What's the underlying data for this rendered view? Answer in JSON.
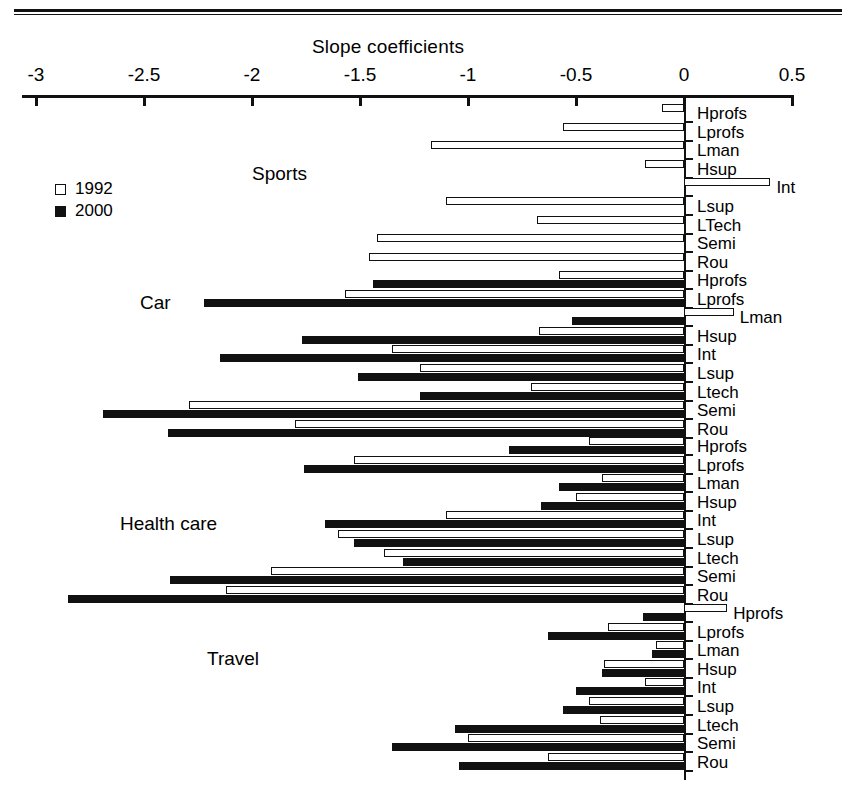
{
  "figure": {
    "axis_title": "Slope coefficients",
    "x_ticks": [
      "-3",
      "-2.5",
      "-2",
      "-1.5",
      "-1",
      "-0.5",
      "0",
      "0.5"
    ]
  },
  "legend": {
    "items": [
      {
        "label": "1992",
        "style": "hollow",
        "color": "#ffffff"
      },
      {
        "label": "2000",
        "style": "filled",
        "color": "#111111"
      }
    ]
  },
  "groups": [
    {
      "name": "Sports"
    },
    {
      "name": "Car"
    },
    {
      "name": "Health care"
    },
    {
      "name": "Travel"
    }
  ],
  "chart_data": {
    "type": "bar",
    "orientation": "horizontal",
    "title": "",
    "xlabel": "Slope coefficients",
    "ylabel": "",
    "xlim": [
      -3,
      0.5
    ],
    "xticks": [
      -3,
      -2.5,
      -2,
      -1.5,
      -1,
      -0.5,
      0,
      0.5
    ],
    "grid": false,
    "legend_position": "upper-left-inside",
    "series_names": [
      "1992",
      "2000"
    ],
    "series_colors": [
      "#ffffff",
      "#111111"
    ],
    "groups": [
      {
        "name": "Sports",
        "categories": [
          "Hprofs",
          "Lprofs",
          "Lman",
          "Hsup",
          "Int",
          "Lsup",
          "LTech",
          "Semi",
          "Rou"
        ],
        "series": [
          {
            "name": "1992",
            "values": [
              -0.1,
              -0.56,
              -1.17,
              -0.18,
              0.4,
              -1.1,
              -0.68,
              -1.42,
              -1.46
            ]
          },
          {
            "name": "2000",
            "values": [
              null,
              null,
              null,
              null,
              null,
              null,
              null,
              null,
              null
            ]
          }
        ]
      },
      {
        "name": "Car",
        "categories": [
          "Hprofs",
          "Lprofs",
          "Lman",
          "Hsup",
          "Int",
          "Lsup",
          "Ltech",
          "Semi",
          "Rou"
        ],
        "series": [
          {
            "name": "1992",
            "values": [
              -0.58,
              -1.57,
              0.23,
              -0.67,
              -1.35,
              -1.22,
              -0.71,
              -2.29,
              -1.8
            ]
          },
          {
            "name": "2000",
            "values": [
              -1.44,
              -2.22,
              -0.52,
              -1.77,
              -2.15,
              -1.51,
              -1.22,
              -2.69,
              -2.39
            ]
          }
        ]
      },
      {
        "name": "Health care",
        "categories": [
          "Hprofs",
          "Lprofs",
          "Lman",
          "Hsup",
          "Int",
          "Lsup",
          "Ltech",
          "Semi",
          "Rou"
        ],
        "series": [
          {
            "name": "1992",
            "values": [
              -0.44,
              -1.53,
              -0.38,
              -0.5,
              -1.1,
              -1.6,
              -1.39,
              -1.91,
              -2.12
            ]
          },
          {
            "name": "2000",
            "values": [
              -0.81,
              -1.76,
              -0.58,
              -0.66,
              -1.66,
              -1.53,
              -1.3,
              -2.38,
              -2.85
            ]
          }
        ]
      },
      {
        "name": "Travel",
        "categories": [
          "Hprofs",
          "Lprofs",
          "Lman",
          "Hsup",
          "Int",
          "Lsup",
          "Ltech",
          "Semi",
          "Rou"
        ],
        "series": [
          {
            "name": "1992",
            "values": [
              0.2,
              -0.35,
              -0.13,
              -0.37,
              -0.18,
              -0.44,
              -0.39,
              -1.0,
              -0.63
            ]
          },
          {
            "name": "2000",
            "values": [
              -0.19,
              -0.63,
              -0.15,
              -0.38,
              -0.5,
              -0.56,
              -1.06,
              -1.35,
              -1.04
            ]
          }
        ]
      }
    ]
  }
}
